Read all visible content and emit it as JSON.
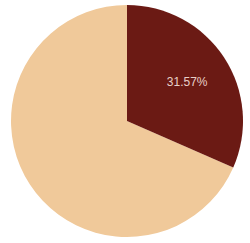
{
  "chart_data": {
    "type": "pie",
    "title": "",
    "labels": [
      "Slice A",
      "Slice B"
    ],
    "values": [
      31.57,
      68.43
    ],
    "value_labels": [
      "31.57%",
      ""
    ],
    "colors": [
      "#6b1a14",
      "#f0c99a"
    ],
    "label_color": "#e8cfc8",
    "start_angle_deg": 90,
    "direction": "clockwise",
    "legend": null
  }
}
